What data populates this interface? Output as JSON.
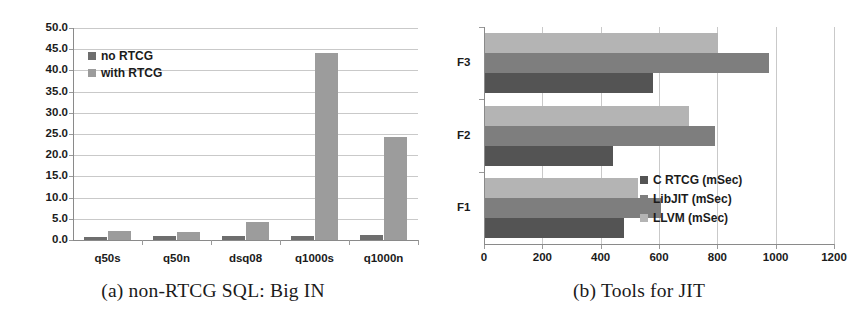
{
  "figure": {
    "panels": [
      {
        "id": "a",
        "caption": "(a) non-RTCG SQL: Big IN"
      },
      {
        "id": "b",
        "caption": "(b) Tools for JIT"
      }
    ]
  },
  "chart_data": [
    {
      "type": "bar",
      "title": "(a) non-RTCG SQL: Big IN",
      "orientation": "vertical",
      "categories": [
        "q50s",
        "q50n",
        "dsq08",
        "q1000s",
        "q1000n"
      ],
      "series": [
        {
          "name": "no RTCG",
          "color": "#6e6e6e",
          "values": [
            0.8,
            0.9,
            1.0,
            1.0,
            1.2
          ]
        },
        {
          "name": "with RTCG",
          "color": "#9c9c9c",
          "values": [
            2.1,
            1.8,
            4.2,
            44.1,
            24.2
          ]
        }
      ],
      "ylabel": "",
      "xlabel": "",
      "ylim": [
        0.0,
        50.0
      ],
      "ytick_labels": [
        "0.0",
        "5.0",
        "10.0",
        "15.0",
        "20.0",
        "25.0",
        "30.0",
        "35.0",
        "40.0",
        "45.0",
        "50.0"
      ],
      "ytick_values": [
        0,
        5,
        10,
        15,
        20,
        25,
        30,
        35,
        40,
        45,
        50
      ],
      "grid": true,
      "legend_position": "upper-left",
      "legend": [
        "no RTCG",
        "with RTCG"
      ]
    },
    {
      "type": "bar",
      "title": "(b) Tools for JIT",
      "orientation": "horizontal",
      "categories": [
        "F1",
        "F2",
        "F3"
      ],
      "series": [
        {
          "name": "C RTCG (mSec)",
          "color": "#545454",
          "values": [
            475,
            440,
            575
          ]
        },
        {
          "name": "LibJIT (mSec)",
          "color": "#7e7e7e",
          "values": [
            605,
            790,
            975
          ]
        },
        {
          "name": "LLVM (mSec)",
          "color": "#b4b4b4",
          "values": [
            525,
            700,
            800
          ]
        }
      ],
      "xlabel": "",
      "ylabel": "",
      "xlim": [
        0,
        1200
      ],
      "xtick_labels": [
        "0",
        "200",
        "400",
        "600",
        "800",
        "1000",
        "1200"
      ],
      "xtick_values": [
        0,
        200,
        400,
        600,
        800,
        1000,
        1200
      ],
      "grid": true,
      "legend_position": "lower-right",
      "legend": [
        "C RTCG (mSec)",
        "LibJIT (mSec)",
        "LLVM (mSec)"
      ]
    }
  ]
}
